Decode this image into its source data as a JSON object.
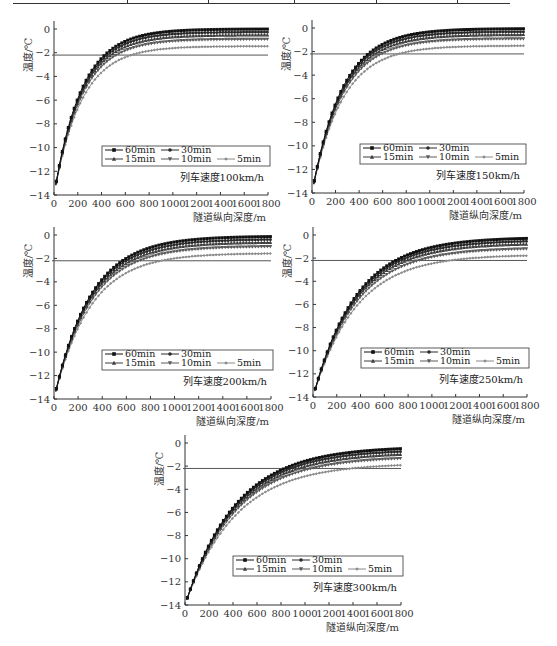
{
  "chart_data": [
    {
      "type": "line",
      "panel": "top-left",
      "title": "列车速度100km/h",
      "xlabel": "隧道纵向深度/m",
      "ylabel": "温度/℃",
      "xlim": [
        0,
        1800
      ],
      "ylim": [
        -14,
        0
      ],
      "xticks": [
        0,
        200,
        400,
        600,
        800,
        1000,
        1200,
        1400,
        1600,
        1800
      ],
      "yticks": [
        0,
        -2,
        -4,
        -6,
        -8,
        -10,
        -12,
        -14
      ],
      "grid": false,
      "decay_length_m": 230,
      "reference_line": -2.2,
      "series": [
        {
          "name": "60min",
          "marker": "square",
          "start": -14,
          "end": 0.0
        },
        {
          "name": "30min",
          "marker": "circle",
          "start": -14,
          "end": -0.25
        },
        {
          "name": "15min",
          "marker": "triangle",
          "start": -14,
          "end": -0.5
        },
        {
          "name": "10min",
          "marker": "triangle-down",
          "start": -14,
          "end": -0.85
        },
        {
          "name": "5min",
          "marker": "diamond",
          "start": -14,
          "end": -1.45
        }
      ]
    },
    {
      "type": "line",
      "panel": "top-right",
      "title": "列车速度150km/h",
      "xlabel": "隧道纵向深度/m",
      "ylabel": "温度/℃",
      "xlim": [
        0,
        1800
      ],
      "ylim": [
        -14,
        0
      ],
      "xticks": [
        0,
        200,
        400,
        600,
        800,
        1000,
        1200,
        1400,
        1600,
        1800
      ],
      "yticks": [
        0,
        -2,
        -4,
        -6,
        -8,
        -10,
        -12,
        -14
      ],
      "grid": false,
      "decay_length_m": 255,
      "reference_line": -2.2,
      "series": [
        {
          "name": "60min",
          "marker": "square",
          "start": -14,
          "end": -0.05
        },
        {
          "name": "30min",
          "marker": "circle",
          "start": -14,
          "end": -0.3
        },
        {
          "name": "15min",
          "marker": "triangle",
          "start": -14,
          "end": -0.55
        },
        {
          "name": "10min",
          "marker": "triangle-down",
          "start": -14,
          "end": -0.9
        },
        {
          "name": "5min",
          "marker": "diamond",
          "start": -14,
          "end": -1.5
        }
      ]
    },
    {
      "type": "line",
      "panel": "middle-left",
      "title": "列车速度200km/h",
      "xlabel": "隧道纵向深度/m",
      "ylabel": "温度/℃",
      "xlim": [
        0,
        1800
      ],
      "ylim": [
        -14,
        0
      ],
      "xticks": [
        0,
        200,
        400,
        600,
        800,
        1000,
        1200,
        1400,
        1600,
        1800
      ],
      "yticks": [
        0,
        -2,
        -4,
        -6,
        -8,
        -10,
        -12,
        -14
      ],
      "grid": false,
      "decay_length_m": 300,
      "reference_line": -2.2,
      "series": [
        {
          "name": "60min",
          "marker": "square",
          "start": -14,
          "end": -0.1
        },
        {
          "name": "30min",
          "marker": "circle",
          "start": -14,
          "end": -0.35
        },
        {
          "name": "15min",
          "marker": "triangle",
          "start": -14,
          "end": -0.6
        },
        {
          "name": "10min",
          "marker": "triangle-down",
          "start": -14,
          "end": -0.95
        },
        {
          "name": "5min",
          "marker": "diamond",
          "start": -14,
          "end": -1.55
        }
      ]
    },
    {
      "type": "line",
      "panel": "middle-right",
      "title": "列车速度250km/h",
      "xlabel": "隧道纵向深度/m",
      "ylabel": "温度/℃",
      "xlim": [
        0,
        1800
      ],
      "ylim": [
        -14,
        0
      ],
      "xticks": [
        0,
        200,
        400,
        600,
        800,
        1000,
        1200,
        1400,
        1600,
        1800
      ],
      "yticks": [
        0,
        -2,
        -4,
        -6,
        -8,
        -10,
        -12,
        -14
      ],
      "grid": false,
      "decay_length_m": 360,
      "reference_line": -2.2,
      "series": [
        {
          "name": "60min",
          "marker": "square",
          "start": -14,
          "end": -0.2
        },
        {
          "name": "30min",
          "marker": "circle",
          "start": -14,
          "end": -0.45
        },
        {
          "name": "15min",
          "marker": "triangle",
          "start": -14,
          "end": -0.7
        },
        {
          "name": "10min",
          "marker": "triangle-down",
          "start": -14,
          "end": -1.1
        },
        {
          "name": "5min",
          "marker": "diamond",
          "start": -14,
          "end": -1.7
        }
      ]
    },
    {
      "type": "line",
      "panel": "bottom-center",
      "title": "列车速度300km/h",
      "xlabel": "隧道纵向深度/m",
      "ylabel": "温度/℃",
      "xlim": [
        0,
        1800
      ],
      "ylim": [
        -14,
        0
      ],
      "xticks": [
        0,
        200,
        400,
        600,
        800,
        1000,
        1200,
        1400,
        1600,
        1800
      ],
      "yticks": [
        0,
        -2,
        -4,
        -6,
        -8,
        -10,
        -12,
        -14
      ],
      "grid": false,
      "decay_length_m": 420,
      "reference_line": -2.2,
      "series": [
        {
          "name": "60min",
          "marker": "square",
          "start": -14,
          "end": -0.3
        },
        {
          "name": "30min",
          "marker": "circle",
          "start": -14,
          "end": -0.55
        },
        {
          "name": "15min",
          "marker": "triangle",
          "start": -14,
          "end": -0.8
        },
        {
          "name": "10min",
          "marker": "triangle-down",
          "start": -14,
          "end": -1.15
        },
        {
          "name": "5min",
          "marker": "diamond",
          "start": -14,
          "end": -1.75
        }
      ]
    }
  ],
  "series_colors": {
    "60min": "#111111",
    "30min": "#2a2a2a",
    "15min": "#3d3d3d",
    "10min": "#5a5a5a",
    "5min": "#8a8a8a"
  },
  "reference_line_color": "#555555",
  "axis_color": "#333333"
}
